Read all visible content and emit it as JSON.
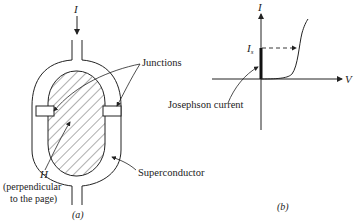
{
  "figure_a": {
    "current_label": "I",
    "junctions_label": "Junctions",
    "superconductor_label": "Superconductor",
    "field_label": "H",
    "field_note_line1": "(perpendicular",
    "field_note_line2": "to the page)",
    "caption": "(a)"
  },
  "figure_b": {
    "y_axis_label": "I",
    "x_axis_label": "V",
    "critical_current_label": "I",
    "critical_current_subscript": "s",
    "josephson_label": "Josephson current",
    "caption": "(b)"
  },
  "colors": {
    "ink": "#222222",
    "background": "#ffffff"
  }
}
